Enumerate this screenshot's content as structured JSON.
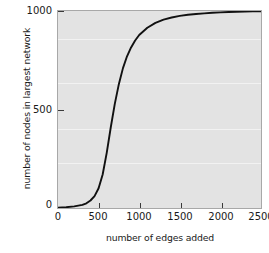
{
  "chart_data": {
    "type": "line",
    "title": "",
    "xlabel": "number of edges added",
    "ylabel": "number of nodes in largest network",
    "xlim": [
      0,
      2500
    ],
    "ylim": [
      0,
      1000
    ],
    "xticks": [
      0,
      500,
      1000,
      1500,
      2000,
      2500
    ],
    "xticklabels": [
      "0",
      "500",
      "1000",
      "1500",
      "2000",
      "2500"
    ],
    "yticks": [
      0,
      500,
      1000
    ],
    "yticklabels": [
      "0",
      "500",
      "1000"
    ],
    "grid": false,
    "legend": null,
    "series": [
      {
        "name": "largest connected component",
        "color": "#111111",
        "x": [
          0,
          100,
          200,
          300,
          350,
          400,
          450,
          500,
          550,
          600,
          650,
          700,
          750,
          800,
          850,
          900,
          950,
          1000,
          1100,
          1200,
          1300,
          1400,
          1500,
          1600,
          1700,
          1800,
          1900,
          2000,
          2100,
          2200,
          2300,
          2400,
          2500
        ],
        "y": [
          2,
          4,
          8,
          16,
          24,
          38,
          60,
          100,
          170,
          280,
          410,
          530,
          630,
          710,
          770,
          815,
          850,
          878,
          915,
          940,
          956,
          967,
          975,
          981,
          985,
          988,
          991,
          993,
          995,
          996,
          997,
          998,
          999
        ]
      }
    ]
  },
  "axes": {
    "plot_background": "#e3e3e3",
    "frame_color": "#a8a8a8",
    "tick_color": "#3a3a3a",
    "curve_color": "#111111"
  }
}
